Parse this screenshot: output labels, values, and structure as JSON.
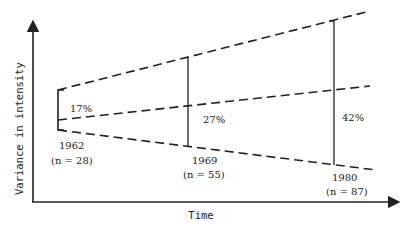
{
  "diagram": {
    "y_axis_label": "Variance in intensity",
    "x_axis_label": "Time",
    "points": [
      {
        "year": "1962",
        "n": "(n = 28)",
        "percent": "17%"
      },
      {
        "year": "1969",
        "n": "(n = 55)",
        "percent": "27%"
      },
      {
        "year": "1980",
        "n": "(n = 87)",
        "percent": "42%"
      }
    ],
    "line_color": "#222222"
  }
}
